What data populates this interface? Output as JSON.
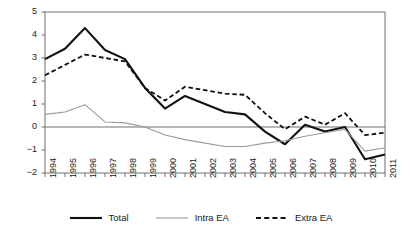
{
  "chart_data": {
    "type": "line",
    "title": "",
    "subtitle": "",
    "xlabel": "",
    "ylabel": "",
    "grid": false,
    "legend_position": "bottom",
    "zero_line": true,
    "x": [
      "1994",
      "1995",
      "1996",
      "1997",
      "1998",
      "1999",
      "2000",
      "2001",
      "2002",
      "2003",
      "2004",
      "2005",
      "2006",
      "2007",
      "2008",
      "2009",
      "2010",
      "2011"
    ],
    "categories": [
      "1994",
      "1995",
      "1996",
      "1997",
      "1998",
      "1999",
      "2000",
      "2001",
      "2002",
      "2003",
      "2004",
      "2005",
      "2006",
      "2007",
      "2008",
      "2009",
      "2010",
      "2011"
    ],
    "xlim": [
      1994,
      2011
    ],
    "ylim": [
      -2,
      5
    ],
    "yticks": [
      5,
      4,
      3,
      2,
      1,
      0,
      -1,
      -2
    ],
    "ytick_labels": [
      "5",
      "4",
      "3",
      "2",
      "1",
      "0",
      "−1",
      "−2"
    ],
    "xtick_labels": [
      "1994",
      "1995",
      "1996",
      "1997",
      "1998",
      "1999",
      "2000",
      "2001",
      "2002",
      "2003",
      "2004",
      "2005",
      "2006",
      "2007",
      "2008",
      "2009",
      "2010",
      "2011"
    ],
    "series": [
      {
        "name": "Total",
        "color": "#111111",
        "style": "solid",
        "width": 2.1,
        "values": [
          2.95,
          3.4,
          4.3,
          3.35,
          2.95,
          1.7,
          0.8,
          1.35,
          1.0,
          0.65,
          0.55,
          -0.2,
          -0.75,
          0.1,
          -0.2,
          0.0,
          -1.4,
          -1.2
        ]
      },
      {
        "name": "Intra EA",
        "color": "#9a9a9a",
        "style": "solid",
        "width": 1.1,
        "values": [
          0.55,
          0.65,
          0.97,
          0.22,
          0.18,
          0.0,
          -0.35,
          -0.55,
          -0.7,
          -0.85,
          -0.85,
          -0.7,
          -0.6,
          -0.4,
          -0.25,
          -0.1,
          -1.05,
          -0.9
        ]
      },
      {
        "name": "Extra EA",
        "color": "#111111",
        "style": "dashed",
        "width": 1.8,
        "values": [
          2.25,
          2.7,
          3.15,
          3.0,
          2.85,
          1.7,
          1.15,
          1.75,
          1.6,
          1.45,
          1.4,
          0.6,
          -0.1,
          0.45,
          0.1,
          0.6,
          -0.35,
          -0.25
        ]
      }
    ]
  },
  "legend": {
    "items": [
      {
        "label": "Total"
      },
      {
        "label": "Intra EA"
      },
      {
        "label": "Extra EA"
      }
    ]
  },
  "colors": {
    "axis": "#6e6e6e",
    "zero_line": "#6e6e6e",
    "total": "#111111",
    "intra_ea": "#9a9a9a",
    "extra_ea": "#111111",
    "background": "#ffffff",
    "text": "#1a1a1a"
  }
}
